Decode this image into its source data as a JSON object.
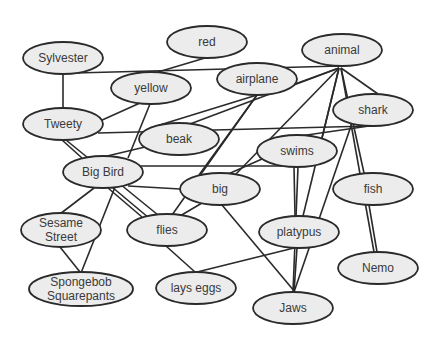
{
  "diagram": {
    "type": "semantic-network",
    "colors": {
      "node_fill": "#ececec",
      "node_stroke": "#2a2a2a",
      "edge": "#2a2a2a",
      "text": "#3a3a3a",
      "background": "#ffffff"
    },
    "nodes": [
      {
        "id": "red",
        "label": "red",
        "lines": [
          "red"
        ],
        "cx": 207,
        "cy": 42,
        "rx": 40,
        "ry": 16
      },
      {
        "id": "animal",
        "label": "animal",
        "lines": [
          "animal"
        ],
        "cx": 342,
        "cy": 50,
        "rx": 40,
        "ry": 16
      },
      {
        "id": "sylvester",
        "label": "Sylvester",
        "lines": [
          "Sylvester"
        ],
        "cx": 63,
        "cy": 58,
        "rx": 40,
        "ry": 16
      },
      {
        "id": "yellow",
        "label": "yellow",
        "lines": [
          "yellow"
        ],
        "cx": 151,
        "cy": 88,
        "rx": 40,
        "ry": 16
      },
      {
        "id": "airplane",
        "label": "airplane",
        "lines": [
          "airplane"
        ],
        "cx": 257,
        "cy": 79,
        "rx": 40,
        "ry": 16
      },
      {
        "id": "shark",
        "label": "shark",
        "lines": [
          "shark"
        ],
        "cx": 373,
        "cy": 110,
        "rx": 40,
        "ry": 16
      },
      {
        "id": "tweety",
        "label": "Tweety",
        "lines": [
          "Tweety"
        ],
        "cx": 63,
        "cy": 124,
        "rx": 40,
        "ry": 16
      },
      {
        "id": "beak",
        "label": "beak",
        "lines": [
          "beak"
        ],
        "cx": 179,
        "cy": 139,
        "rx": 40,
        "ry": 16
      },
      {
        "id": "swims",
        "label": "swims",
        "lines": [
          "swims"
        ],
        "cx": 297,
        "cy": 151,
        "rx": 40,
        "ry": 16
      },
      {
        "id": "bigbird",
        "label": "Big Bird",
        "lines": [
          "Big Bird"
        ],
        "cx": 103,
        "cy": 172,
        "rx": 40,
        "ry": 16
      },
      {
        "id": "big",
        "label": "big",
        "lines": [
          "big"
        ],
        "cx": 220,
        "cy": 189,
        "rx": 40,
        "ry": 16
      },
      {
        "id": "fish",
        "label": "fish",
        "lines": [
          "fish"
        ],
        "cx": 373,
        "cy": 189,
        "rx": 40,
        "ry": 16
      },
      {
        "id": "sesame",
        "label": "Sesame Street",
        "lines": [
          "Sesame",
          "Street"
        ],
        "cx": 61,
        "cy": 230,
        "rx": 40,
        "ry": 17
      },
      {
        "id": "flies",
        "label": "flies",
        "lines": [
          "flies"
        ],
        "cx": 167,
        "cy": 230,
        "rx": 40,
        "ry": 16
      },
      {
        "id": "platypus",
        "label": "platypus",
        "lines": [
          "platypus"
        ],
        "cx": 299,
        "cy": 232,
        "rx": 40,
        "ry": 16
      },
      {
        "id": "nemo",
        "label": "Nemo",
        "lines": [
          "Nemo"
        ],
        "cx": 378,
        "cy": 268,
        "rx": 40,
        "ry": 16
      },
      {
        "id": "spongebob",
        "label": "Spongebob Squarepants",
        "lines": [
          "Spongebob",
          "Squarepants"
        ],
        "cx": 81,
        "cy": 289,
        "rx": 52,
        "ry": 17
      },
      {
        "id": "layseggs",
        "label": "lays eggs",
        "lines": [
          "lays eggs"
        ],
        "cx": 196,
        "cy": 288,
        "rx": 40,
        "ry": 16
      },
      {
        "id": "jaws",
        "label": "Jaws",
        "lines": [
          "Jaws"
        ],
        "cx": 293,
        "cy": 308,
        "rx": 40,
        "ry": 16
      }
    ],
    "edges": [
      {
        "from": "sylvester",
        "to": "animal",
        "x1": 75,
        "y1": 73,
        "x2": 340,
        "y2": 66
      },
      {
        "from": "sylvester",
        "to": "tweety",
        "x1": 63,
        "y1": 74,
        "x2": 63,
        "y2": 108
      },
      {
        "from": "red",
        "to": "yellow",
        "x1": 205,
        "y1": 58,
        "x2": 158,
        "y2": 72
      },
      {
        "from": "animal",
        "to": "airplane",
        "x1": 339,
        "y1": 68,
        "x2": 295,
        "y2": 84
      },
      {
        "from": "animal",
        "to": "beak",
        "x1": 339,
        "y1": 68,
        "x2": 190,
        "y2": 124
      },
      {
        "from": "animal",
        "to": "big",
        "x1": 339,
        "y1": 68,
        "x2": 236,
        "y2": 174
      },
      {
        "from": "animal",
        "to": "shark",
        "x1": 341,
        "y1": 68,
        "x2": 378,
        "y2": 94
      },
      {
        "from": "animal",
        "to": "swims",
        "x1": 339,
        "y1": 68,
        "x2": 322,
        "y2": 138
      },
      {
        "from": "animal",
        "to": "platypus",
        "x1": 339,
        "y1": 68,
        "x2": 303,
        "y2": 216
      },
      {
        "from": "animal",
        "to": "fish",
        "x1": 341,
        "y1": 68,
        "x2": 364,
        "y2": 173
      },
      {
        "from": "animal",
        "to": "nemo",
        "x1": 341,
        "y1": 68,
        "x2": 374,
        "y2": 252
      },
      {
        "from": "yellow",
        "to": "tweety",
        "x1": 140,
        "y1": 103,
        "x2": 100,
        "y2": 121
      },
      {
        "from": "yellow",
        "to": "bigbird",
        "x1": 150,
        "y1": 104,
        "x2": 128,
        "y2": 158
      },
      {
        "from": "tweety",
        "to": "shark",
        "x1": 98,
        "y1": 133,
        "x2": 370,
        "y2": 126
      },
      {
        "from": "tweety",
        "to": "bigbird",
        "x1": 62,
        "y1": 140,
        "x2": 82,
        "y2": 158
      },
      {
        "from": "tweety",
        "to": "flies",
        "x1": 66,
        "y1": 140,
        "x2": 158,
        "y2": 215
      },
      {
        "from": "beak",
        "to": "bigbird",
        "x1": 145,
        "y1": 147,
        "x2": 103,
        "y2": 157
      },
      {
        "from": "bigbird",
        "to": "swims",
        "x1": 141,
        "y1": 166,
        "x2": 300,
        "y2": 166
      },
      {
        "from": "airplane",
        "to": "beak",
        "x1": 257,
        "y1": 95,
        "x2": 150,
        "y2": 128
      },
      {
        "from": "airplane",
        "to": "big",
        "x1": 257,
        "y1": 95,
        "x2": 199,
        "y2": 175
      },
      {
        "from": "airplane",
        "to": "flies",
        "x1": 257,
        "y1": 95,
        "x2": 172,
        "y2": 215
      },
      {
        "from": "shark",
        "to": "swims",
        "x1": 376,
        "y1": 125,
        "x2": 300,
        "y2": 136
      },
      {
        "from": "shark",
        "to": "jaws",
        "x1": 352,
        "y1": 123,
        "x2": 294,
        "y2": 292
      },
      {
        "from": "bigbird",
        "to": "big",
        "x1": 128,
        "y1": 186,
        "x2": 180,
        "y2": 189
      },
      {
        "from": "bigbird",
        "to": "sesame",
        "x1": 94,
        "y1": 188,
        "x2": 60,
        "y2": 214
      },
      {
        "from": "bigbird",
        "to": "spongebob",
        "x1": 115,
        "y1": 187,
        "x2": 81,
        "y2": 273
      },
      {
        "from": "bigbird",
        "to": "flies",
        "x1": 108,
        "y1": 188,
        "x2": 142,
        "y2": 217
      },
      {
        "from": "bigbird",
        "to": "layseggs",
        "x1": 112,
        "y1": 187,
        "x2": 149,
        "y2": 218
      },
      {
        "from": "big",
        "to": "swims",
        "x1": 226,
        "y1": 175,
        "x2": 262,
        "y2": 159
      },
      {
        "from": "big",
        "to": "flies",
        "x1": 202,
        "y1": 203,
        "x2": 180,
        "y2": 216
      },
      {
        "from": "big",
        "to": "jaws",
        "x1": 222,
        "y1": 205,
        "x2": 295,
        "y2": 292
      },
      {
        "from": "swims",
        "to": "platypus",
        "x1": 294,
        "y1": 167,
        "x2": 295,
        "y2": 216
      },
      {
        "from": "swims",
        "to": "jaws",
        "x1": 298,
        "y1": 167,
        "x2": 293,
        "y2": 292
      },
      {
        "from": "fish",
        "to": "nemo",
        "x1": 369,
        "y1": 205,
        "x2": 377,
        "y2": 252
      },
      {
        "from": "sesame",
        "to": "spongebob",
        "x1": 60,
        "y1": 247,
        "x2": 80,
        "y2": 272
      },
      {
        "from": "flies",
        "to": "layseggs",
        "x1": 166,
        "y1": 246,
        "x2": 195,
        "y2": 272
      },
      {
        "from": "platypus",
        "to": "layseggs",
        "x1": 294,
        "y1": 248,
        "x2": 197,
        "y2": 272
      },
      {
        "from": "platypus",
        "to": "jaws",
        "x1": 297,
        "y1": 248,
        "x2": 294,
        "y2": 292
      }
    ]
  }
}
